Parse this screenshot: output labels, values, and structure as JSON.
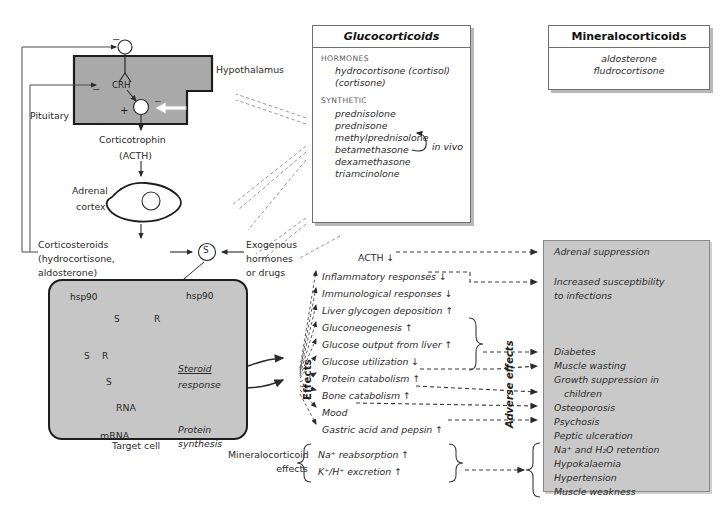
{
  "hpa_axis": {
    "hypothalamus_label": "Hypothalamus",
    "pituitary_label": "Pituitary",
    "crh_label": "CRH",
    "corticotrophin_label": "Corticotrophin",
    "acth_paren_label": "(ACTH)",
    "adrenal_label_line1": "Adrenal",
    "adrenal_label_line2": "cortex",
    "corticosteroids_line1": "Corticosteroids",
    "corticosteroids_line2": "(hydrocortisone,",
    "corticosteroids_line3": "aldosterone)",
    "exogenous_line1": "Exogenous",
    "exogenous_line2": "hormones",
    "exogenous_line3": "or drugs",
    "minus_sign": "−",
    "plus_sign": "+",
    "steroid_symbol": "S"
  },
  "target_cell": {
    "caption": "Target cell",
    "hsp90_left": "hsp90",
    "hsp90_right": "hsp90",
    "receptor_symbol": "R",
    "steroid_symbol": "S",
    "sr_steroid": "S",
    "sr_receptor": "R",
    "nucleus_steroid": "S",
    "rna_label": "RNA",
    "mrna_label": "mRNA",
    "protein_line1": "Protein",
    "protein_line2": "synthesis",
    "steroid_resp_line1": "Steroid",
    "steroid_resp_line2": "response"
  },
  "glucocorticoids_box": {
    "title": "Glucocorticoids",
    "hormones_heading": "HORMONES",
    "hormones": [
      "hydrocortisone (cortisol)",
      "(cortisone)"
    ],
    "synthetic_heading": "SYNTHETIC",
    "synthetic": [
      "prednisolone",
      "prednisone",
      "methylprednisolone",
      "betamethasone",
      "dexamethasone",
      "triamcinolone"
    ],
    "in_vivo_label": "in vivo"
  },
  "mineralocorticoids_box": {
    "title": "Mineralocorticoids",
    "items": [
      "aldosterone",
      "fludrocortisone"
    ]
  },
  "effects": {
    "axis_label": "Effects",
    "adverse_axis_label": "Adverse effects",
    "acth_row": "ACTH ↓",
    "rows": [
      "Inflammatory responses ↓",
      "Immunological responses ↓",
      "Liver glycogen deposition ↑",
      "Gluconeogenesis ↑",
      "Glucose output from liver ↑",
      "Glucose utilization ↓",
      "Protein catabolism ↑",
      "Bone catabolism ↑",
      "Mood",
      "Gastric acid and pepsin ↑"
    ]
  },
  "mineralocorticoid_effects": {
    "label_line1": "Mineralocorticoid",
    "label_line2": "effects",
    "rows": [
      "Na⁺ reabsorption ↑",
      "K⁺/H⁺ excretion ↑"
    ]
  },
  "adverse_effects_box": {
    "group1": [
      "Adrenal suppression",
      "Increased susceptibility",
      "to infections"
    ],
    "group2": [
      "Diabetes",
      "Muscle wasting",
      "Growth suppression in",
      "children",
      "Osteoporosis",
      "Psychosis",
      "Peptic ulceration"
    ],
    "group3": [
      "Na⁺ and H₂O retention",
      "Hypokalaemia",
      "Hypertension",
      "Muscle weakness"
    ]
  },
  "colors": {
    "gray_fill": "#c9c9c9",
    "cell_fill": "#c6c6c6",
    "stroke": "#2b2b2b",
    "panel_border": "#6f6f6f",
    "shadow": "#b9b9b9"
  }
}
